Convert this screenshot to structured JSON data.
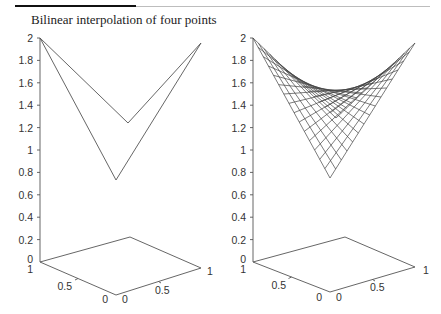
{
  "figure": {
    "title": "Bilinear interpolation of four points"
  },
  "chart_data": [
    {
      "type": "line",
      "title": "Bilinear interpolation of four points",
      "description": "3D plot of four corner points connected by straight edges (left panel)",
      "xlabel": "",
      "ylabel": "",
      "zlabel": "",
      "xlim": [
        0,
        1
      ],
      "ylim": [
        0,
        1
      ],
      "zlim": [
        0,
        2
      ],
      "x_ticks": [
        "0",
        "0.5",
        "1"
      ],
      "y_ticks": [
        "0",
        "0.5",
        "1"
      ],
      "z_ticks": [
        "0",
        "0.2",
        "0.4",
        "0.6",
        "0.8",
        "1",
        "1.2",
        "1.4",
        "1.6",
        "1.8",
        "2"
      ],
      "points": [
        {
          "x": 0,
          "y": 0,
          "z": 1
        },
        {
          "x": 1,
          "y": 0,
          "z": 2
        },
        {
          "x": 0,
          "y": 1,
          "z": 2
        },
        {
          "x": 1,
          "y": 1,
          "z": 0.5
        }
      ],
      "grid": false
    },
    {
      "type": "surface",
      "title": "",
      "description": "Bilinear interpolated surface mesh through the four points (right panel)",
      "xlim": [
        0,
        1
      ],
      "ylim": [
        0,
        1
      ],
      "zlim": [
        0,
        2
      ],
      "x_ticks": [
        "0",
        "0.5",
        "1"
      ],
      "y_ticks": [
        "0",
        "0.5",
        "1"
      ],
      "z_ticks": [
        "0",
        "0.2",
        "0.4",
        "0.6",
        "0.8",
        "1",
        "1.2",
        "1.4",
        "1.6",
        "1.8",
        "2"
      ],
      "mesh_lines": 15,
      "grid": false
    }
  ],
  "left_axis": {
    "z_labels": [
      "2",
      "1.8",
      "1.6",
      "1.4",
      "1.2",
      "1",
      "0.8",
      "0.6",
      "0.4",
      "0.2",
      "0"
    ],
    "y_labels": [
      "1",
      "0.5",
      "0"
    ],
    "x_labels": [
      "0",
      "0.5",
      "1"
    ]
  },
  "right_axis": {
    "z_labels": [
      "2",
      "1.8",
      "1.6",
      "1.4",
      "1.2",
      "1",
      "0.8",
      "0.6",
      "0.4",
      "0.2",
      "0"
    ],
    "y_labels": [
      "1",
      "0.5",
      "0"
    ],
    "x_labels": [
      "0",
      "0.5",
      "1"
    ]
  }
}
